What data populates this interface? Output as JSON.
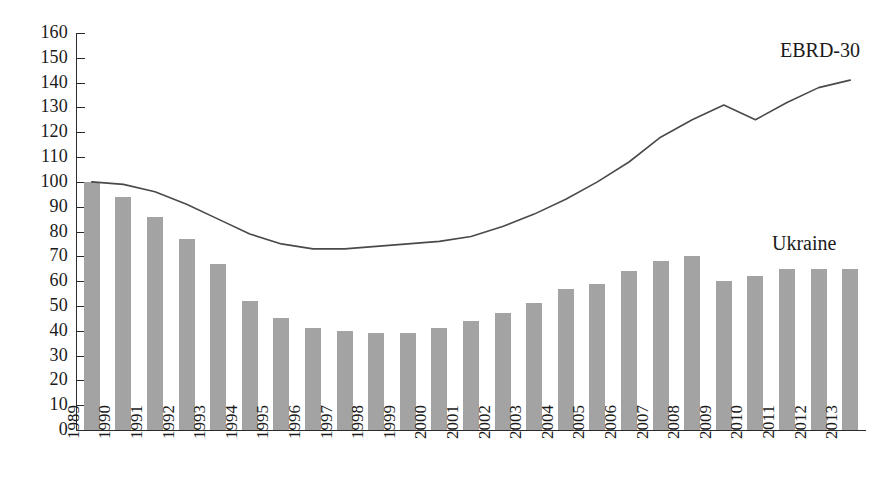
{
  "chart_data": {
    "type": "bar",
    "title": "",
    "subtitle": "",
    "xlabel": "",
    "ylabel": "",
    "ylim": [
      0,
      160
    ],
    "ytick_step": 10,
    "grid": false,
    "legend_position": "inline-annotation",
    "categories": [
      "1989",
      "1990",
      "1991",
      "1992",
      "1993",
      "1994",
      "1995",
      "1996",
      "1997",
      "1998",
      "1999",
      "2000",
      "2001",
      "2002",
      "2003",
      "2004",
      "2005",
      "2006",
      "2007",
      "2008",
      "2009",
      "2010",
      "2011",
      "2012",
      "2013"
    ],
    "yticks": [
      "0",
      "10",
      "20",
      "30",
      "40",
      "50",
      "60",
      "70",
      "80",
      "90",
      "100",
      "110",
      "120",
      "130",
      "140",
      "150",
      "160"
    ],
    "series": [
      {
        "name": "Ukraine",
        "type": "bar",
        "color": "#a3a3a3",
        "values": [
          100,
          94,
          86,
          77,
          67,
          52,
          45,
          41,
          40,
          39,
          39,
          41,
          44,
          47,
          51,
          57,
          59,
          64,
          68,
          70,
          60,
          62,
          65,
          65,
          65
        ]
      },
      {
        "name": "EBRD-30",
        "type": "line",
        "color": "#4a4a4a",
        "values": [
          100,
          99,
          96,
          91,
          85,
          79,
          75,
          73,
          73,
          75,
          75,
          76,
          76,
          77,
          79,
          80,
          81,
          82,
          84,
          87,
          89,
          91,
          94,
          96,
          99
        ]
      }
    ],
    "annotations": [
      {
        "id": "ebrd",
        "label": "EBRD-30"
      },
      {
        "id": "ukraine",
        "label": "Ukraine"
      }
    ]
  },
  "ebrd_line_plot_values": [
    100,
    99,
    96,
    91,
    85,
    79,
    75,
    73,
    73,
    74,
    75,
    76,
    78,
    82,
    87,
    93,
    100,
    108,
    118,
    125,
    131,
    125,
    132,
    138,
    141
  ],
  "colors": {
    "bar_fill": "#a3a3a3",
    "line_stroke": "#4a4a4a",
    "axis": "#2b2b2b",
    "background": "#ffffff",
    "text": "#1a1a1a"
  }
}
